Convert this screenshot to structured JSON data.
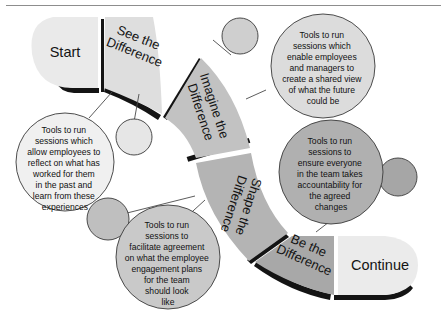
{
  "diagram": {
    "type": "process-s-curve",
    "title_visible": false,
    "background_color": "#ffffff",
    "top_rule_color": "#8d8d8d",
    "segments": [
      {
        "id": "start",
        "label": "Start",
        "label_lines": [
          "Start"
        ],
        "fill": "#eaeaea",
        "order": 1
      },
      {
        "id": "see-the-difference",
        "label": "See the Difference",
        "label_lines": [
          "See the",
          "Difference"
        ],
        "fill": "#dedede",
        "order": 2
      },
      {
        "id": "imagine-the-difference",
        "label": "Imagine the Difference",
        "label_lines": [
          "Imagine the",
          "Difference"
        ],
        "fill": "#c2c2c2",
        "order": 3
      },
      {
        "id": "shape-the-difference",
        "label": "Shape the Difference",
        "label_lines": [
          "Shape the",
          "Difference"
        ],
        "fill": "#b4b4b4",
        "order": 4
      },
      {
        "id": "be-the-difference",
        "label": "Be the Difference",
        "label_lines": [
          "Be the",
          "Difference"
        ],
        "fill": "#a8a8a8",
        "order": 5
      },
      {
        "id": "continue",
        "label": "Continue",
        "label_lines": [
          "Continue"
        ],
        "fill": "#ebebeb",
        "order": 6
      }
    ],
    "callouts": [
      {
        "id": "callout-see",
        "target_segment": "see-the-difference",
        "fill": "#f0f0f0",
        "text": "Tools to run sessions which allow employees to reflect on what has worked for them in the past and learn from these experiences",
        "lines": [
          "Tools to run",
          "sessions which",
          "allow employees to",
          "reflect on what has",
          "worked for them",
          "in the past and",
          "learn from these",
          "experiences"
        ]
      },
      {
        "id": "callout-imagine",
        "target_segment": "imagine-the-difference",
        "fill": "#dcdcdc",
        "text": "Tools to run sessions which enable employees and managers to create a shared view of what the future could be",
        "lines": [
          "Tools to run",
          "sessions which",
          "enable employees",
          "and managers to",
          "create a shared view",
          "of what the future",
          "could be"
        ]
      },
      {
        "id": "callout-shape",
        "target_segment": "shape-the-difference",
        "fill": "#c9c9c9",
        "text": "Tools to run sessions to facilitate agreement on what the employee engagement plans for the team should look like",
        "lines": [
          "Tools to run",
          "sessions to",
          "facilitate agreement",
          "on what the employee",
          "engagement plans",
          "for the team",
          "should look",
          "like"
        ]
      },
      {
        "id": "callout-be",
        "target_segment": "be-the-difference",
        "fill": "#b0b0b0",
        "text": "Tools to run sessions to ensure everyone in the team takes accountability for the agreed changes",
        "lines": [
          "Tools to run",
          "sessions to",
          "ensure everyone",
          "in the team takes",
          "accountability for",
          "the agreed",
          "changes"
        ]
      }
    ],
    "connector_dots": [
      {
        "id": "dot-see",
        "fill": "#e6e6e6"
      },
      {
        "id": "dot-imagine",
        "fill": "#cfcfcf"
      },
      {
        "id": "dot-shape",
        "fill": "#bfbfbf"
      },
      {
        "id": "dot-be",
        "fill": "#a6a6a6"
      }
    ]
  }
}
